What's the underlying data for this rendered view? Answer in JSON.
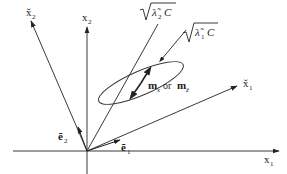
{
  "diagram": {
    "type": "coordinate-rotation-ellipse",
    "colors": {
      "stroke": "#3a3a3a",
      "text": "#222222",
      "background": "#ffffff"
    },
    "axes": {
      "x1": {
        "label": "x",
        "sub": "1"
      },
      "x2": {
        "label": "x",
        "sub": "2"
      },
      "x1_rot": {
        "label": "x̌",
        "sub": "1"
      },
      "x2_rot": {
        "label": "x̌",
        "sub": "2"
      }
    },
    "basis_vectors": {
      "e1": {
        "label": "ẽ",
        "sub": "1"
      },
      "e2": {
        "label": "ẽ",
        "sub": "2"
      }
    },
    "annotations": {
      "sqrt_lambda2": {
        "radicand": "λ̃",
        "sub": "2",
        "tail": "C"
      },
      "sqrt_lambda1": {
        "radicand": "λ̃",
        "sub": "1",
        "tail": "C"
      },
      "mean_label": {
        "m1": "m",
        "m1_sub": "x",
        "or": "or",
        "m2": "m",
        "m2_sub": "ž"
      }
    }
  }
}
